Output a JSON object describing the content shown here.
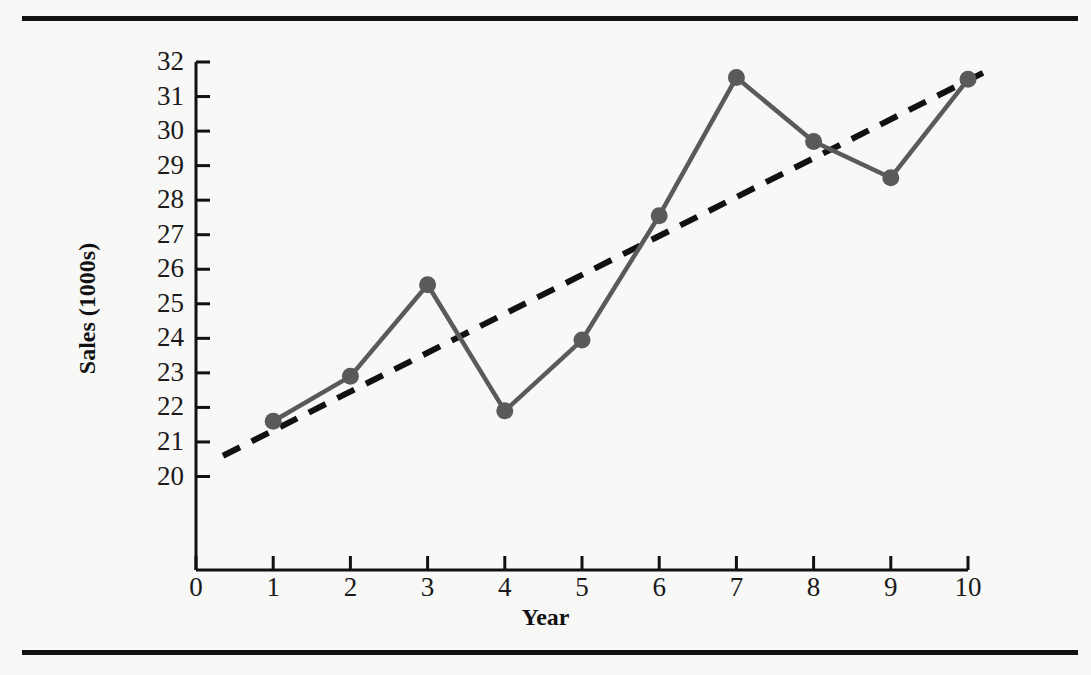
{
  "figure": {
    "background_color": "#f8f8f6",
    "rule_color": "#111111",
    "series_color": "#5a5a5a",
    "trend_color": "#111111"
  },
  "chart_data": {
    "type": "line",
    "title": "",
    "xlabel": "Year",
    "ylabel": "Sales (1000s)",
    "xlim": [
      0,
      10
    ],
    "ylim": [
      20,
      32
    ],
    "grid": false,
    "legend": "none",
    "x": [
      1,
      2,
      3,
      4,
      5,
      6,
      7,
      8,
      9,
      10
    ],
    "xticks": [
      "0",
      "1",
      "2",
      "3",
      "4",
      "5",
      "6",
      "7",
      "8",
      "9",
      "10"
    ],
    "yticks": [
      "20",
      "21",
      "22",
      "23",
      "24",
      "25",
      "26",
      "27",
      "28",
      "29",
      "30",
      "31",
      "32"
    ],
    "series": [
      {
        "name": "Sales",
        "style": "solid-with-circle-markers",
        "color": "#5a5a5a",
        "values": [
          21.6,
          22.9,
          25.55,
          21.9,
          23.95,
          27.55,
          31.55,
          29.7,
          28.65,
          31.5
        ]
      },
      {
        "name": "Trend line",
        "style": "dashed",
        "color": "#111111",
        "x_range": [
          0.35,
          10.25
        ],
        "y_range": [
          20.6,
          31.75
        ]
      }
    ]
  }
}
